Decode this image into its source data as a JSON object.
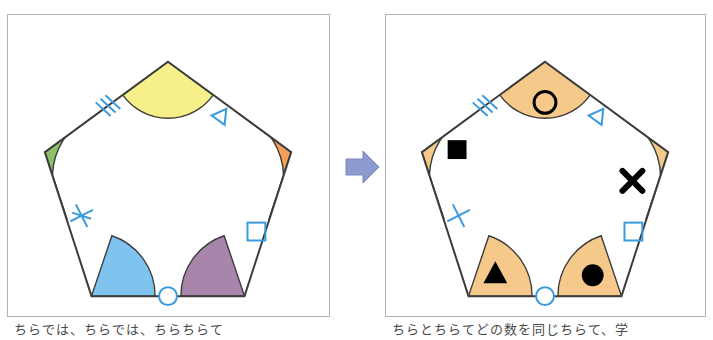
{
  "figure": {
    "background_color": "#ffffff",
    "panel_border_color": "#b3b3b3",
    "outline_color": "#3c3c3c",
    "mark_color": "#3a9bdc"
  },
  "arrow": {
    "name": "transformation-arrow",
    "direction": "right",
    "fill_color": "#8b9bcf",
    "stroke_color": "#7886c0"
  },
  "panels": [
    {
      "id": "left",
      "label": "Colored pentagon",
      "shape": "pentagon",
      "vertices": [
        {
          "name": "top",
          "label": "top vertex",
          "angle_color": "#f7ef8a",
          "symbol": "",
          "symbol_kind": "none"
        },
        {
          "name": "upper-right",
          "label": "upper right vertex",
          "angle_color": "#f5a05a",
          "symbol": "",
          "symbol_kind": "none"
        },
        {
          "name": "lower-right",
          "label": "lower right vertex",
          "angle_color": "#a885ab",
          "symbol": "",
          "symbol_kind": "none"
        },
        {
          "name": "lower-left",
          "label": "lower left vertex",
          "angle_color": "#7fc4ee",
          "symbol": "",
          "symbol_kind": "none"
        },
        {
          "name": "upper-left",
          "label": "upper left vertex",
          "angle_color": "#8cc06a",
          "symbol": "",
          "symbol_kind": "none"
        }
      ],
      "edge_marks": [
        {
          "name": "edge-mark-triple-tick",
          "edge": "top-left edge",
          "glyph": "///",
          "kind": "triple-tick"
        },
        {
          "name": "edge-mark-triangle",
          "edge": "top-right edge",
          "glyph": "△",
          "kind": "triangle"
        },
        {
          "name": "edge-mark-square",
          "edge": "right edge",
          "glyph": "□",
          "kind": "square"
        },
        {
          "name": "edge-mark-circle",
          "edge": "bottom edge",
          "glyph": "○",
          "kind": "circle"
        },
        {
          "name": "edge-mark-cross",
          "edge": "left edge",
          "glyph": "✕",
          "kind": "cross"
        }
      ]
    },
    {
      "id": "right",
      "label": "Tan pentagon with symbols",
      "shape": "pentagon",
      "angle_fill_color": "#f5c98a",
      "vertices": [
        {
          "name": "top",
          "label": "top vertex",
          "angle_color": "#f5c98a",
          "symbol": "○",
          "symbol_kind": "open-circle"
        },
        {
          "name": "upper-right",
          "label": "upper right vertex",
          "angle_color": "#f5c98a",
          "symbol": "✕",
          "symbol_kind": "cross"
        },
        {
          "name": "lower-right",
          "label": "lower right vertex",
          "angle_color": "#f5c98a",
          "symbol": "●",
          "symbol_kind": "filled-circle"
        },
        {
          "name": "lower-left",
          "label": "lower left vertex",
          "angle_color": "#f5c98a",
          "symbol": "▲",
          "symbol_kind": "filled-triangle"
        },
        {
          "name": "upper-left",
          "label": "upper left vertex",
          "angle_color": "#f5c98a",
          "symbol": "■",
          "symbol_kind": "filled-square"
        }
      ],
      "edge_marks": [
        {
          "name": "edge-mark-triple-tick",
          "edge": "top-left edge",
          "glyph": "///",
          "kind": "triple-tick"
        },
        {
          "name": "edge-mark-triangle",
          "edge": "top-right edge",
          "glyph": "△",
          "kind": "triangle"
        },
        {
          "name": "edge-mark-square",
          "edge": "right edge",
          "glyph": "□",
          "kind": "square"
        },
        {
          "name": "edge-mark-circle",
          "edge": "bottom edge",
          "glyph": "○",
          "kind": "circle"
        },
        {
          "name": "edge-mark-cross",
          "edge": "left edge",
          "glyph": "✕",
          "kind": "cross"
        }
      ]
    }
  ],
  "captions": {
    "left": "ちらでは、ちらでは、ちらちらて",
    "right": "ちらとちらてどの数を同じちらて、学"
  }
}
